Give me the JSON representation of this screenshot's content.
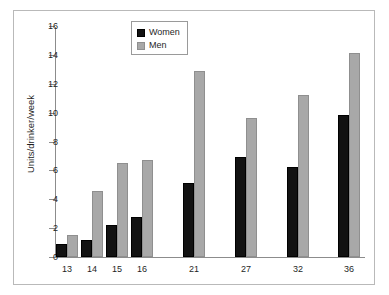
{
  "chart_data": {
    "type": "bar",
    "title": "",
    "xlabel": "",
    "ylabel": "Units/drinker/week",
    "categories": [
      "13",
      "14",
      "15",
      "16",
      "21",
      "27",
      "32",
      "36"
    ],
    "series": [
      {
        "name": "Women",
        "color": "#121212",
        "values": [
          0.9,
          1.2,
          2.25,
          2.8,
          5.15,
          6.95,
          6.25,
          9.85
        ]
      },
      {
        "name": "Men",
        "color": "#a8a8a8",
        "values": [
          1.5,
          4.6,
          6.5,
          6.7,
          12.85,
          9.6,
          11.2,
          14.1
        ]
      }
    ],
    "ylim": [
      0,
      16
    ],
    "yticks": [
      0,
      2,
      4,
      6,
      8,
      10,
      12,
      14,
      16
    ],
    "grid": false,
    "legend_position": "top-center"
  },
  "legend": {
    "items": [
      {
        "label": "Women",
        "swatch": "black-square-swatch"
      },
      {
        "label": "Men",
        "swatch": "gray-square-swatch"
      }
    ]
  },
  "axes": {
    "y_title": "Units/drinker/week",
    "y_tick_labels": [
      "16",
      "14",
      "12",
      "10",
      "8",
      "6",
      "4",
      "2",
      "0"
    ],
    "x_tick_labels": [
      "13",
      "14",
      "15",
      "16",
      "21",
      "27",
      "32",
      "36"
    ]
  }
}
